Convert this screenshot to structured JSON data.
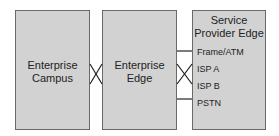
{
  "diagram": {
    "boxes": [
      {
        "id": "enterprise-campus",
        "label_lines": [
          "Enterprise",
          "Campus"
        ]
      },
      {
        "id": "enterprise-edge",
        "label_lines": [
          "Enterprise",
          "Edge"
        ]
      },
      {
        "id": "service-provider-edge",
        "label_lines": [
          "Service",
          "Provider Edge"
        ],
        "items": [
          "Frame/ATM",
          "ISP A",
          "ISP B",
          "PSTN"
        ]
      }
    ],
    "connections": [
      {
        "from": "enterprise-campus",
        "to": "enterprise-edge",
        "style": "cross"
      },
      {
        "from": "enterprise-edge",
        "to": "Frame/ATM",
        "style": "line"
      },
      {
        "from": "enterprise-edge",
        "to": "ISP A",
        "style": "cross"
      },
      {
        "from": "enterprise-edge",
        "to": "ISP B",
        "style": "cross"
      },
      {
        "from": "enterprise-edge",
        "to": "PSTN",
        "style": "line"
      }
    ],
    "colors": {
      "box_fill": "#d2d2d2",
      "border": "#6a6a6a",
      "text": "#222222"
    }
  }
}
